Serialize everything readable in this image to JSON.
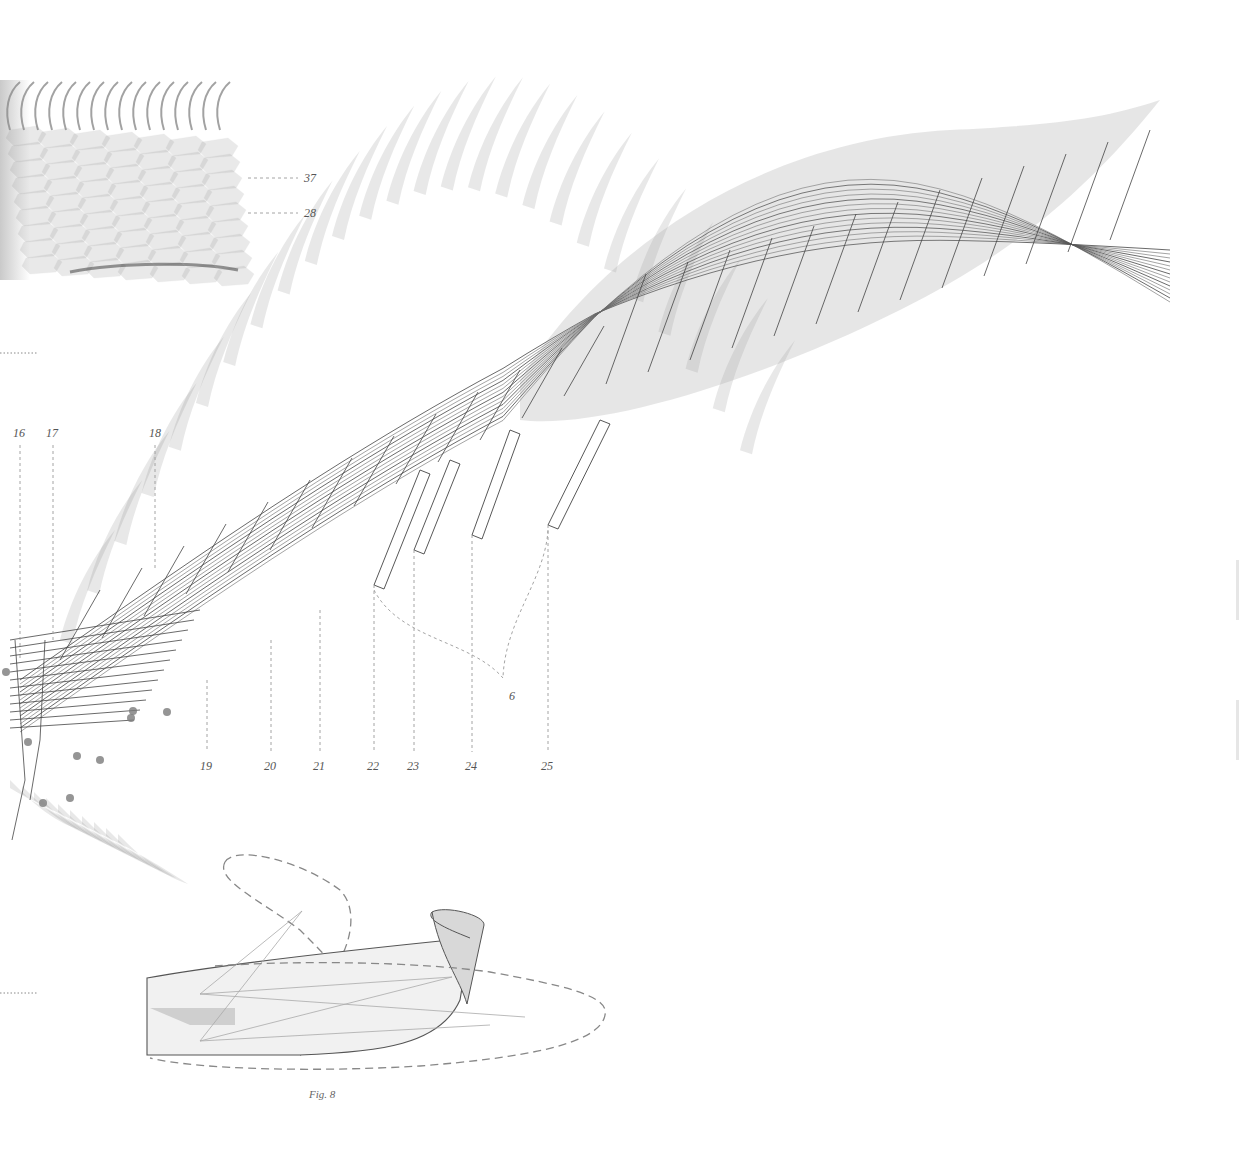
{
  "figure": {
    "caption": "Fig. 8",
    "palette": {
      "ink": "#444444",
      "wash": "#6e6e6e",
      "leader": "#9a9a9a",
      "paper": "#ffffff"
    }
  },
  "callouts": {
    "top": [
      {
        "id": "37",
        "label": "37"
      },
      {
        "id": "28",
        "label": "28"
      }
    ],
    "upper_row": [
      {
        "id": "16",
        "label": "16"
      },
      {
        "id": "17",
        "label": "17"
      },
      {
        "id": "18",
        "label": "18"
      }
    ],
    "lower_row": [
      {
        "id": "19",
        "label": "19"
      },
      {
        "id": "20",
        "label": "20"
      },
      {
        "id": "21",
        "label": "21"
      },
      {
        "id": "22",
        "label": "22"
      },
      {
        "id": "23",
        "label": "23"
      },
      {
        "id": "24",
        "label": "24"
      },
      {
        "id": "25",
        "label": "25"
      }
    ],
    "group": {
      "id": "6",
      "label": "6"
    }
  }
}
